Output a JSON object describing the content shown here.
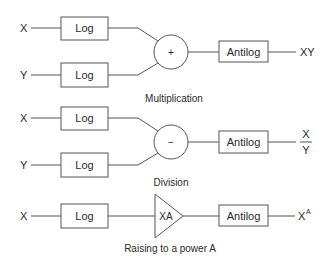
{
  "diagram": {
    "multiplication": {
      "caption": "Multiplication",
      "input_top": "X",
      "input_bottom": "Y",
      "log_top": "Log",
      "log_bottom": "Log",
      "operator": "+",
      "antilog": "Antilog",
      "output": "XY"
    },
    "division": {
      "caption": "Division",
      "input_top": "X",
      "input_bottom": "Y",
      "log_top": "Log",
      "log_bottom": "Log",
      "operator": "−",
      "antilog": "Antilog",
      "output_numerator": "X",
      "output_denominator": "Y"
    },
    "power": {
      "caption": "Raising to a power A",
      "input": "X",
      "log": "Log",
      "amplifier": "XA",
      "antilog": "Antilog",
      "output_base": "X",
      "output_exponent": "A"
    }
  },
  "colors": {
    "line": "#555555",
    "text": "#2a2a2a",
    "background": "#ffffff"
  }
}
